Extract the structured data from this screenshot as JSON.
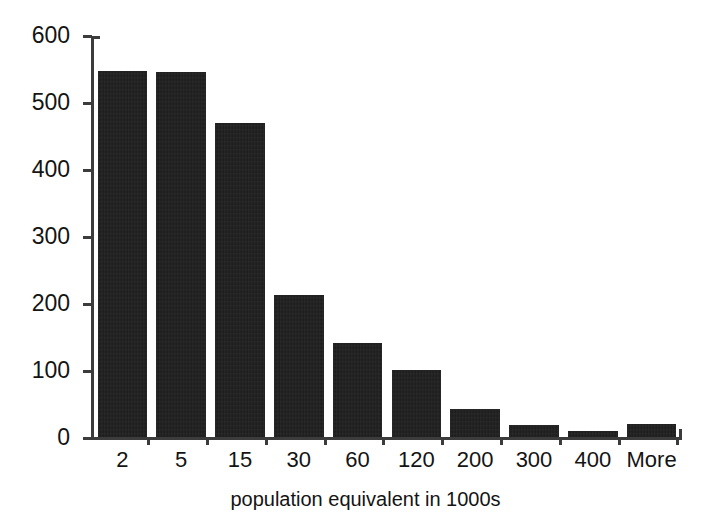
{
  "chart_data": {
    "type": "bar",
    "title": "",
    "subtitle": "",
    "xlabel": "population equivalent in 1000s",
    "ylabel": "",
    "categories": [
      "2",
      "5",
      "15",
      "30",
      "60",
      "120",
      "200",
      "300",
      "400",
      "More"
    ],
    "values": [
      548,
      547,
      470,
      214,
      142,
      102,
      43,
      20,
      11,
      21
    ],
    "series": [
      {
        "name": "frequency",
        "values": [
          548,
          547,
          470,
          214,
          142,
          102,
          43,
          20,
          11,
          21
        ]
      }
    ],
    "ylim": [
      0,
      600
    ],
    "y_ticks": [
      0,
      100,
      200,
      300,
      400,
      500,
      600
    ],
    "y_tick_labels": [
      "0",
      "100",
      "200",
      "300",
      "400",
      "500",
      "600"
    ],
    "grid": false,
    "legend": false,
    "legend_position": "none",
    "bar_color": "#1b1b1b",
    "axis_color": "#3c3c3c",
    "background_color": "#ffffff",
    "text_color": "#141414"
  }
}
